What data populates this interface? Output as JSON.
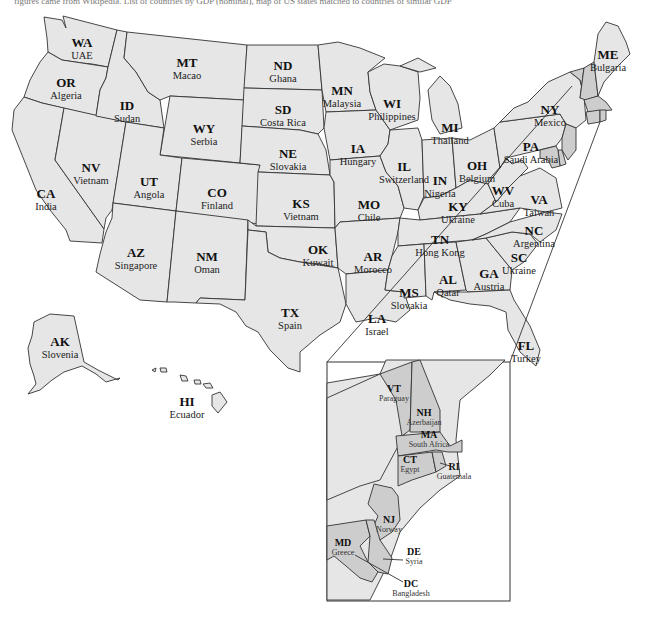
{
  "caption": "figures came from Wikipedia. List of countries by GDP (nominal), map of US states matched to countries of similar GDP",
  "colors": {
    "state_fill": "#e6e6e6",
    "inset_state_fill": "#cdcdcd",
    "border": "#333333",
    "background": "#ffffff"
  },
  "states": [
    {
      "abbr": "WA",
      "country": "UAE",
      "x": 82,
      "y": 36
    },
    {
      "abbr": "OR",
      "country": "Algeria",
      "x": 66,
      "y": 76
    },
    {
      "abbr": "ID",
      "country": "Sudan",
      "x": 127,
      "y": 99
    },
    {
      "abbr": "MT",
      "country": "Macao",
      "x": 187,
      "y": 56
    },
    {
      "abbr": "WY",
      "country": "Serbia",
      "x": 204,
      "y": 122
    },
    {
      "abbr": "ND",
      "country": "Ghana",
      "x": 283,
      "y": 59
    },
    {
      "abbr": "SD",
      "country": "Costa Rica",
      "x": 283,
      "y": 103
    },
    {
      "abbr": "NE",
      "country": "Slovakia",
      "x": 288,
      "y": 147
    },
    {
      "abbr": "MN",
      "country": "Malaysia",
      "x": 342,
      "y": 84
    },
    {
      "abbr": "WI",
      "country": "Philippines",
      "x": 392,
      "y": 97
    },
    {
      "abbr": "MI",
      "country": "Thailand",
      "x": 450,
      "y": 121
    },
    {
      "abbr": "IA",
      "country": "Hungary",
      "x": 358,
      "y": 142
    },
    {
      "abbr": "IL",
      "country": "Switzerland",
      "x": 404,
      "y": 160
    },
    {
      "abbr": "IN",
      "country": "Nigeria",
      "x": 440,
      "y": 174
    },
    {
      "abbr": "OH",
      "country": "Belgium",
      "x": 477,
      "y": 159
    },
    {
      "abbr": "NY",
      "country": "Mexico",
      "x": 550,
      "y": 103
    },
    {
      "abbr": "PA",
      "country": "Saudi Arabia",
      "x": 531,
      "y": 140
    },
    {
      "abbr": "ME",
      "country": "Bulgaria",
      "x": 608,
      "y": 48
    },
    {
      "abbr": "NV",
      "country": "Vietnam",
      "x": 91,
      "y": 161
    },
    {
      "abbr": "CA",
      "country": "India",
      "x": 46,
      "y": 187
    },
    {
      "abbr": "UT",
      "country": "Angola",
      "x": 149,
      "y": 175
    },
    {
      "abbr": "CO",
      "country": "Finland",
      "x": 217,
      "y": 186
    },
    {
      "abbr": "KS",
      "country": "Vietnam",
      "x": 301,
      "y": 197
    },
    {
      "abbr": "MO",
      "country": "Chile",
      "x": 369,
      "y": 198
    },
    {
      "abbr": "KY",
      "country": "Ukraine",
      "x": 458,
      "y": 200
    },
    {
      "abbr": "WV",
      "country": "Cuba",
      "x": 503,
      "y": 184
    },
    {
      "abbr": "VA",
      "country": "Taiwan",
      "x": 539,
      "y": 193
    },
    {
      "abbr": "NC",
      "country": "Argentina",
      "x": 534,
      "y": 224
    },
    {
      "abbr": "TN",
      "country": "Hong Kong",
      "x": 440,
      "y": 233
    },
    {
      "abbr": "SC",
      "country": "Ukraine",
      "x": 519,
      "y": 251
    },
    {
      "abbr": "AZ",
      "country": "Singapore",
      "x": 136,
      "y": 246
    },
    {
      "abbr": "NM",
      "country": "Oman",
      "x": 207,
      "y": 250
    },
    {
      "abbr": "OK",
      "country": "Kuwait",
      "x": 318,
      "y": 243
    },
    {
      "abbr": "AR",
      "country": "Morocco",
      "x": 373,
      "y": 250
    },
    {
      "abbr": "MS",
      "country": "Slovakia",
      "x": 409,
      "y": 286
    },
    {
      "abbr": "AL",
      "country": "Qatar",
      "x": 448,
      "y": 273
    },
    {
      "abbr": "GA",
      "country": "Austria",
      "x": 489,
      "y": 267
    },
    {
      "abbr": "LA",
      "country": "Israel",
      "x": 377,
      "y": 312
    },
    {
      "abbr": "TX",
      "country": "Spain",
      "x": 290,
      "y": 306
    },
    {
      "abbr": "FL",
      "country": "Turkey",
      "x": 526,
      "y": 339
    },
    {
      "abbr": "AK",
      "country": "Slovenia",
      "x": 60,
      "y": 335
    },
    {
      "abbr": "HI",
      "country": "Ecuador",
      "x": 187,
      "y": 395
    }
  ],
  "inset": {
    "states": [
      {
        "abbr": "VT",
        "country": "Paraguay",
        "x": 394,
        "y": 384
      },
      {
        "abbr": "NH",
        "country": "Azerbaijan",
        "x": 424,
        "y": 408
      },
      {
        "abbr": "MA",
        "country": "South Africa",
        "x": 429,
        "y": 430
      },
      {
        "abbr": "CT",
        "country": "Egypt",
        "x": 410,
        "y": 455
      },
      {
        "abbr": "RI",
        "country": "Guatemala",
        "x": 454,
        "y": 462
      },
      {
        "abbr": "NJ",
        "country": "Norway",
        "x": 389,
        "y": 515
      },
      {
        "abbr": "MD",
        "country": "Greece",
        "x": 343,
        "y": 538
      },
      {
        "abbr": "DE",
        "country": "Syria",
        "x": 414,
        "y": 547
      },
      {
        "abbr": "DC",
        "country": "Bangladesh",
        "x": 411,
        "y": 579
      }
    ]
  }
}
